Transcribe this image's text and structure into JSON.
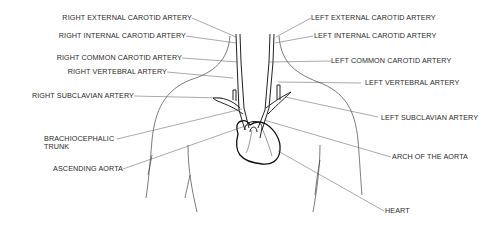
{
  "diagram": {
    "labels_right_side": [
      {
        "id": "right-external-carotid",
        "text": "RIGHT EXTERNAL CAROTID ARTERY"
      },
      {
        "id": "right-internal-carotid",
        "text": "RIGHT INTERNAL CAROTID ARTERY"
      },
      {
        "id": "right-common-carotid",
        "text": "RIGHT COMMON CAROTID ARTERY"
      },
      {
        "id": "right-vertebral",
        "text": "RIGHT VERTEBRAL ARTERY"
      },
      {
        "id": "right-subclavian",
        "text": "RIGHT SUBCLAVIAN ARTERY"
      },
      {
        "id": "brachiocephalic-trunk",
        "text": "BRACHIOCEPHALIC",
        "text2": "TRUNK"
      },
      {
        "id": "ascending-aorta",
        "text": "ASCENDING AORTA"
      }
    ],
    "labels_left_side": [
      {
        "id": "left-external-carotid",
        "text": "LEFT EXTERNAL CAROTID ARTERY"
      },
      {
        "id": "left-internal-carotid",
        "text": "LEFT INTERNAL CAROTID ARTERY"
      },
      {
        "id": "left-common-carotid",
        "text": "LEFT COMMON CAROTID ARTERY"
      },
      {
        "id": "left-vertebral",
        "text": "LEFT VERTEBRAL ARTERY"
      },
      {
        "id": "left-subclavian",
        "text": "LEFT SUBCLAVIAN ARTERY"
      },
      {
        "id": "arch-of-aorta",
        "text": "ARCH OF THE AORTA"
      },
      {
        "id": "heart",
        "text": "HEART"
      }
    ],
    "colors": {
      "line": "#333333",
      "text": "#2a2a2a",
      "background": "#ffffff"
    }
  }
}
